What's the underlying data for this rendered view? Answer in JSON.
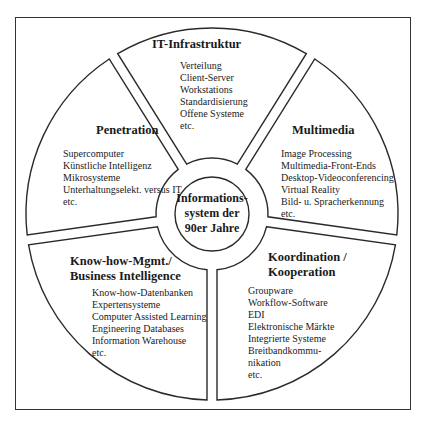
{
  "diagram": {
    "center": {
      "lines": [
        "Informations-",
        "system der",
        "90er Jahre"
      ]
    },
    "segments": [
      {
        "id": "it-infrastruktur",
        "title": [
          "IT-Infrastruktur"
        ],
        "items": [
          "Verteilung",
          "Client-Server",
          "Workstations",
          "Standardisierung",
          "Offene Systeme",
          "etc."
        ]
      },
      {
        "id": "multimedia",
        "title": [
          "Multimedia"
        ],
        "items": [
          "Image Processing",
          "Multimedia-Front-Ends",
          "Desktop-Videoconferencing",
          "Virtual Reality",
          "Bild- u. Spracherkennung",
          "etc."
        ]
      },
      {
        "id": "koordination",
        "title": [
          "Koordination /",
          "Kooperation"
        ],
        "items": [
          "Groupware",
          "Workflow-Software",
          "EDI",
          "Elektronische Märkte",
          "Integrierte Systeme",
          "Breitbandkommu-",
          "nikation",
          "etc."
        ]
      },
      {
        "id": "know-how",
        "title": [
          "Know-how-Mgmt./",
          "Business Intelligence"
        ],
        "items": [
          "Know-how-Datenbanken",
          "Expertensysteme",
          "Computer Assisted Learning",
          "Engineering Databases",
          "Information Warehouse",
          "etc."
        ]
      },
      {
        "id": "penetration",
        "title": [
          "Penetration"
        ],
        "items": [
          "Supercomputer",
          "Künstliche Intelligenz",
          "Mikrosysteme",
          "Unterhaltungselekt. versus IT",
          "etc."
        ]
      }
    ],
    "colors": {
      "line": "#2a2a2a",
      "background": "#ffffff",
      "text": "#1a1a1a"
    }
  }
}
